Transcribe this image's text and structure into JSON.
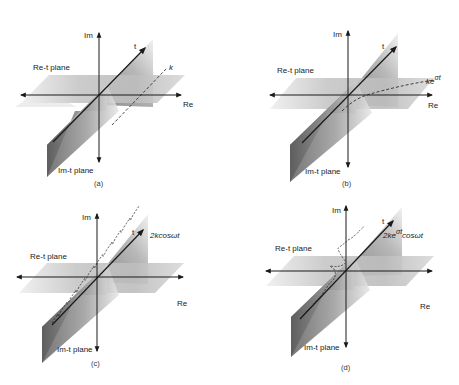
{
  "figure": {
    "panels": [
      {
        "id": "a",
        "caption": "(a)",
        "axes": {
          "im": "Im",
          "re": "Re",
          "t": "t"
        },
        "planes": {
          "re_t": "Re-t plane",
          "im_t": "Im-t plane"
        },
        "curve_label": "k",
        "curve_description": "dashed straight line parallel to t-axis in Re-t plane"
      },
      {
        "id": "b",
        "caption": "(b)",
        "axes": {
          "im": "Im",
          "re": "Re",
          "t": "t"
        },
        "planes": {
          "re_t": "Re-t plane",
          "im_t": "Im-t plane"
        },
        "curve_label_base": "ke",
        "curve_label_sup": "σt",
        "curve_description": "dashed exponential curve in Re-t plane"
      },
      {
        "id": "c",
        "caption": "(c)",
        "axes": {
          "im": "Im",
          "re": "Re",
          "t": "t"
        },
        "planes": {
          "re_t": "Re-t plane",
          "im_t": "Im-t plane"
        },
        "curve_label": "2kcosωt",
        "curve_description": "dashed sinusoid oscillating about t-axis in Re-t plane"
      },
      {
        "id": "d",
        "caption": "(d)",
        "axes": {
          "im": "Im",
          "re": "Re",
          "t": "t"
        },
        "planes": {
          "re_t": "Re-t plane",
          "im_t": "Im-t plane"
        },
        "curve_label_base": "2ke",
        "curve_label_sup": "σt",
        "curve_label_tail": "cosωt",
        "curve_description": "dashed damped sinusoid about t-axis in Re-t plane"
      }
    ],
    "colors": {
      "plane_dark": "#6e6e6e",
      "plane_light": "#d8d8d8",
      "axis": "#1a1a1a",
      "text": "#222222"
    }
  }
}
